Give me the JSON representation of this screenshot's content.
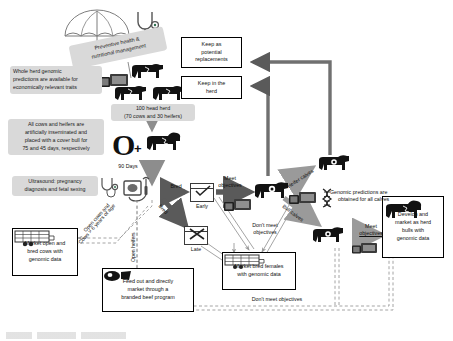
{
  "figure": {
    "caption_partial": ""
  },
  "colors": {
    "callout_bg": "#d9d9d9",
    "box_border": "#000000",
    "arrow_grey": "#8d8d8d",
    "arrow_dark": "#5a5a5a",
    "dashed_grey": "#9a9a9a",
    "page_bg": "#ffffff",
    "animal_black": "#111111"
  },
  "callouts": [
    {
      "id": "preventive",
      "text": "Preventive health & nutritional management"
    },
    {
      "id": "wholeherd",
      "text": "Whole herd genomic predictions are available for economically relevant traits"
    },
    {
      "id": "breeding",
      "text": "All cows and heifers are artificially inseminated and placed with a cover bull for 75 and 45 days, respectively"
    },
    {
      "id": "ultrasound",
      "text": "Ultrasound: pregnancy diagnosis and fetal sexing"
    },
    {
      "id": "herdsize",
      "text": "100 head herd (70 cows and 30 heifers)"
    }
  ],
  "callout_lines": {
    "preventive": [
      "Preventive health &",
      "nutritional management"
    ],
    "wholeherd": [
      "Whole herd genomic",
      "predictions are available for",
      "economically relevant traits"
    ],
    "breeding": [
      "All cows and heifers are",
      "artificially inseminated and",
      "placed with a cover bull for",
      "75 and 45 days, respectively"
    ],
    "ultrasound": [
      "Ultrasound: pregnancy",
      "diagnosis and fetal sexing"
    ],
    "herdsize": [
      "100 head herd",
      "(70 cows and 30 heifers)"
    ]
  },
  "boxes": [
    {
      "id": "keep-replacements",
      "lines": [
        "Keep as",
        "potential",
        "replacements"
      ]
    },
    {
      "id": "keep-herd",
      "lines": [
        "Keep in the",
        "herd"
      ]
    },
    {
      "id": "market-open-bred",
      "lines": [
        "Market open and",
        "bred cows with",
        "genomic data"
      ],
      "icon": "livestock-trailer-icon"
    },
    {
      "id": "market-bred-females",
      "lines": [
        "Market bred females",
        "with genomic data"
      ],
      "icon": "livestock-trailer-icon"
    },
    {
      "id": "feed-out",
      "lines": [
        "Feed out and directly",
        "market through a",
        "branded beef program"
      ],
      "icon": "beef-cuts-icon"
    },
    {
      "id": "develop-bulls",
      "lines": [
        "Develop and",
        "market as herd",
        "bulls with",
        "genomic data"
      ],
      "icon": "bull-icon"
    }
  ],
  "calendars": [
    {
      "id": "early",
      "label": "Early",
      "glyph": "check"
    },
    {
      "id": "late",
      "label": "Late",
      "glyph": "cross"
    }
  ],
  "labels": {
    "days_90": "90 Days",
    "bred_early": "Bred",
    "bred_late": "Bred",
    "meet_objectives_1": [
      "Meet",
      "objectives"
    ],
    "dont_meet_objectives_1": [
      "Don't meet",
      "objectives"
    ],
    "dont_meet_objectives_2": "Don't meet objectives",
    "heifer_calves": "Heifer calves",
    "bull_calves": "Bull calves",
    "genomic_predictions_calves": [
      "Genomic predictions are",
      "obtained for all calves"
    ],
    "meet_objectives_2": [
      "Meet",
      "objectives"
    ],
    "open_cows": [
      "Open cows and",
      "Cows > 6 years of age"
    ],
    "open_heifers": "Open heifers"
  },
  "icons": {
    "umbrella": "umbrella-icon",
    "stethoscope": "stethoscope-icon",
    "monitor": "computer-monitor-icon",
    "dna": "dna-icon",
    "cow": "cow-icon",
    "bull": "bull-icon",
    "calf": "calf-icon",
    "ultrasound": "ultrasound-machine-icon",
    "trailer": "livestock-trailer-icon",
    "beef_cuts": "beef-cuts-icon",
    "calendar_check": "calendar-check-icon",
    "calendar_cross": "calendar-cross-icon",
    "open_zero": "open-cow-zero-icon"
  }
}
